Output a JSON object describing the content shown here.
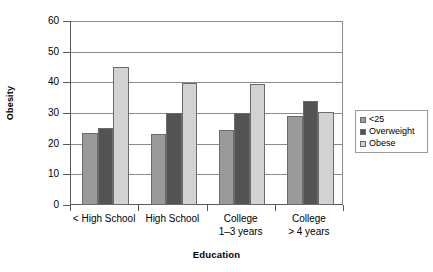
{
  "chart_data": {
    "type": "bar",
    "title": "",
    "xlabel": "Education",
    "ylabel": "Obesity",
    "ylim": [
      0,
      60
    ],
    "yticks": [
      0,
      10,
      20,
      30,
      40,
      50,
      60
    ],
    "ytick_labels": [
      "0",
      "10",
      "20",
      "30",
      "40",
      "50",
      "60"
    ],
    "grid": true,
    "legend_position": "right",
    "categories": [
      {
        "line1": "< High School",
        "line2": ""
      },
      {
        "line1": "High School",
        "line2": ""
      },
      {
        "line1": "College",
        "line2": "1–3 years"
      },
      {
        "line1": "College",
        "line2": "> 4 years"
      }
    ],
    "category_labels": [
      "< High School",
      "High School",
      "College 1–3 years",
      "College > 4 years"
    ],
    "series": [
      {
        "name": "<25",
        "color": "#9a9a9a",
        "values": [
          23.5,
          23,
          24.5,
          29
        ]
      },
      {
        "name": "Overweight",
        "color": "#535353",
        "values": [
          25,
          30,
          30,
          34
        ]
      },
      {
        "name": "Obese",
        "color": "#d2d2d2",
        "values": [
          45,
          39.7,
          39.3,
          30.2
        ]
      }
    ]
  },
  "legend": {
    "items": [
      {
        "label": "<25",
        "color": "#9a9a9a"
      },
      {
        "label": "Overweight",
        "color": "#535353"
      },
      {
        "label": "Obese",
        "color": "#d2d2d2"
      }
    ]
  }
}
